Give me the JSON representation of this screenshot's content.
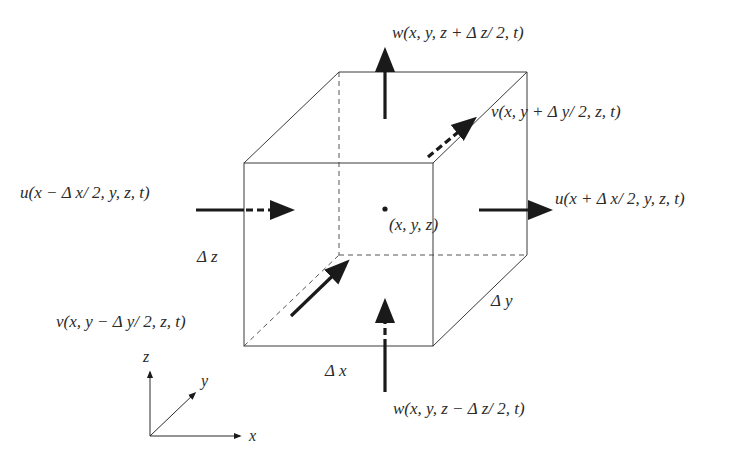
{
  "diagram": {
    "center_label": "(x, y, z)",
    "dimensions": {
      "dx": "Δ x",
      "dy": "Δ y",
      "dz": "Δ z"
    },
    "fluxes": {
      "w_top": "w(x, y, z + Δ z/ 2, t)",
      "w_bottom": "w(x, y, z − Δ z/ 2, t)",
      "u_left": "u(x − Δ x/ 2, y, z, t)",
      "u_right": "u(x + Δ x/ 2, y, z, t)",
      "v_back": "v(x, y + Δ y/ 2, z, t)",
      "v_front": "v(x, y − Δ y/ 2, z, t)"
    },
    "axes": {
      "x": "x",
      "y": "y",
      "z": "z"
    }
  }
}
